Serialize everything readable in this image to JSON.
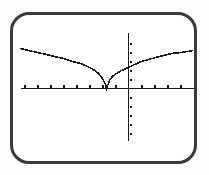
{
  "window": {
    "background_color": "#fdfdfd",
    "frame_color": "#3a3a3a",
    "plot_color": "#1a1a1a"
  },
  "chart_data": {
    "type": "line",
    "title": "",
    "xlabel": "",
    "ylabel": "",
    "legend": "none",
    "grid": false,
    "axes_style": "calculator-crosshair-axes",
    "xlim": [
      -8.3,
      5.0
    ],
    "ylim": [
      -5.8,
      6.2
    ],
    "xscl": 1,
    "yscl": 1,
    "x_ticks": [
      -8,
      -7,
      -6,
      -5,
      -4,
      -3,
      -2,
      -1,
      1,
      2,
      3,
      4
    ],
    "y_ticks": [
      -5,
      -4,
      -3,
      -2,
      -1,
      1,
      2,
      3,
      4,
      5
    ],
    "series": [
      {
        "name": "y1-square-root-v-curve",
        "description": "V-shaped square-root curve with cusp on the x-axis near x = -1.7; resembles y = a*sqrt(|x + 1.7|)",
        "points": [
          [
            -8.31,
            4.44
          ],
          [
            -7.69,
            4.22
          ],
          [
            -7.0,
            4.0
          ],
          [
            -6.31,
            3.78
          ],
          [
            -5.69,
            3.56
          ],
          [
            -5.0,
            3.33
          ],
          [
            -4.31,
            3.0
          ],
          [
            -3.69,
            2.78
          ],
          [
            -3.15,
            2.44
          ],
          [
            -2.69,
            2.11
          ],
          [
            -2.31,
            1.67
          ],
          [
            -2.0,
            1.11
          ],
          [
            -1.77,
            0.44
          ],
          [
            -1.69,
            0.0
          ],
          [
            -1.46,
            0.89
          ],
          [
            -1.23,
            1.33
          ],
          [
            -0.92,
            1.67
          ],
          [
            -0.54,
            2.0
          ],
          [
            0.0,
            2.33
          ],
          [
            0.46,
            2.67
          ],
          [
            1.0,
            3.0
          ],
          [
            1.54,
            3.22
          ],
          [
            2.08,
            3.44
          ],
          [
            2.69,
            3.67
          ],
          [
            3.31,
            3.89
          ],
          [
            4.0,
            4.0
          ],
          [
            4.54,
            4.11
          ],
          [
            5.0,
            4.22
          ]
        ]
      }
    ]
  }
}
